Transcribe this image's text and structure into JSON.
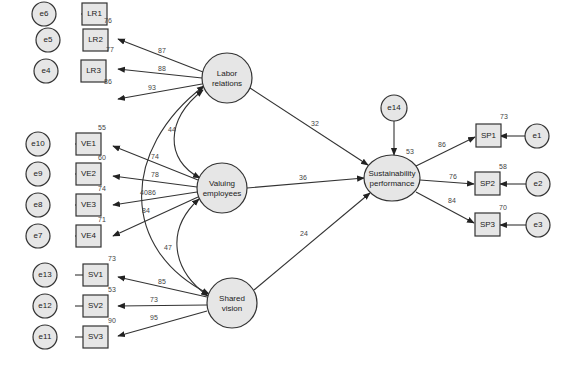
{
  "diagram": {
    "type": "structural-equation-model",
    "latents": [
      {
        "id": "LR",
        "label_lines": [
          "Labor",
          "relations"
        ],
        "cx": 227,
        "cy": 78,
        "r": 25
      },
      {
        "id": "VE",
        "label_lines": [
          "Valuing",
          "employees"
        ],
        "cx": 222,
        "cy": 188,
        "r": 25
      },
      {
        "id": "SV",
        "label_lines": [
          "Shared",
          "vision"
        ],
        "cx": 232,
        "cy": 303,
        "r": 25
      },
      {
        "id": "SP",
        "label_lines": [
          "Sustainability",
          "performance"
        ],
        "cx": 392,
        "cy": 178,
        "rx": 28,
        "ry": 23
      }
    ],
    "indicators": [
      {
        "id": "LR1",
        "x": 95,
        "y": 24,
        "r2": "76",
        "error": "e6",
        "loading": "87",
        "latent": "LR"
      },
      {
        "id": "LR2",
        "x": 95,
        "y": 68,
        "r2": "77",
        "error": "e5",
        "loading": "88",
        "latent": "LR"
      },
      {
        "id": "LR3",
        "x": 95,
        "y": 99,
        "r2": "86",
        "error": "e4",
        "loading": "93",
        "latent": "LR"
      },
      {
        "id": "VE1",
        "x": 95,
        "y": 144,
        "r2": "55",
        "error": "e10",
        "loading": "74",
        "latent": "VE"
      },
      {
        "id": "VE2",
        "x": 95,
        "y": 174,
        "r2": "60",
        "error": "e9",
        "loading": "78",
        "latent": "VE"
      },
      {
        "id": "VE3",
        "x": 95,
        "y": 205,
        "r2": "74",
        "error": "e8",
        "loading": "86",
        "latent": "VE"
      },
      {
        "id": "VE4",
        "x": 95,
        "y": 236,
        "r2": "71",
        "error": "e7",
        "loading": "84",
        "latent": "VE"
      },
      {
        "id": "SV1",
        "x": 95,
        "y": 274,
        "r2": "73",
        "error": "e13",
        "loading": "85",
        "latent": "SV"
      },
      {
        "id": "SV2",
        "x": 95,
        "y": 305,
        "r2": "53",
        "error": "e12",
        "loading": "73",
        "latent": "SV"
      },
      {
        "id": "SV3",
        "x": 95,
        "y": 336,
        "r2": "90",
        "error": "e11",
        "loading": "95",
        "latent": "SV"
      }
    ],
    "outcome_indicators": [
      {
        "id": "SP1",
        "x": 488,
        "y": 136,
        "r2": "73",
        "error": "e1",
        "loading": "86"
      },
      {
        "id": "SP2",
        "x": 487,
        "y": 184,
        "r2": "58",
        "error": "e2",
        "loading": "76"
      },
      {
        "id": "SP3",
        "x": 487,
        "y": 225,
        "r2": "70",
        "error": "e3",
        "loading": "84"
      }
    ],
    "structural_paths": [
      {
        "from": "LR",
        "to": "SP",
        "coef": "32"
      },
      {
        "from": "VE",
        "to": "SP",
        "coef": "36"
      },
      {
        "from": "SV",
        "to": "SP",
        "coef": "24"
      }
    ],
    "covariances": [
      {
        "between": [
          "LR",
          "VE"
        ],
        "value": "44"
      },
      {
        "between": [
          "VE",
          "SV"
        ],
        "value": "47"
      },
      {
        "between": [
          "LR",
          "SV"
        ],
        "value": "40"
      }
    ],
    "disturbance": {
      "id": "e14",
      "target": "SP",
      "r2": "53"
    }
  },
  "labels": {
    "LR1": "LR1",
    "LR2": "LR2",
    "LR3": "LR3",
    "VE1": "VE1",
    "VE2": "VE2",
    "VE3": "VE3",
    "VE4": "VE4",
    "SV1": "SV1",
    "SV2": "SV2",
    "SV3": "SV3",
    "SP1": "SP1",
    "SP2": "SP2",
    "SP3": "SP3",
    "e1": "e1",
    "e2": "e2",
    "e3": "e3",
    "e4": "e4",
    "e5": "e5",
    "e6": "e6",
    "e7": "e7",
    "e8": "e8",
    "e9": "e9",
    "e10": "e10",
    "e11": "e11",
    "e12": "e12",
    "e13": "e13",
    "e14": "e14",
    "LR_l1": "Labor",
    "LR_l2": "relations",
    "VE_l1": "Valuing",
    "VE_l2": "employees",
    "SV_l1": "Shared",
    "SV_l2": "vision",
    "SP_l1": "Sustainability",
    "SP_l2": "performance"
  },
  "values": {
    "r2_LR1": "76",
    "r2_LR2": "77",
    "r2_LR3": "86",
    "r2_VE1": "55",
    "r2_VE2": "60",
    "r2_VE3": "74",
    "r2_VE4": "71",
    "r2_SV1": "73",
    "r2_SV2": "53",
    "r2_SV3": "90",
    "r2_SP1": "73",
    "r2_SP2": "58",
    "r2_SP3": "70",
    "r2_SP": "53",
    "ld_LR1": "87",
    "ld_LR2": "88",
    "ld_LR3": "93",
    "ld_VE1": "74",
    "ld_VE2": "78",
    "ld_VE3": "86",
    "ld_VE4": "84",
    "ld_SV1": "85",
    "ld_SV2": "73",
    "ld_SV3": "95",
    "ld_SP1": "86",
    "ld_SP2": "76",
    "ld_SP3": "84",
    "path_LR_SP": "32",
    "path_VE_SP": "36",
    "path_SV_SP": "24",
    "cov_LR_VE": "44",
    "cov_VE_SV": "47",
    "cov_LR_SV": "40"
  }
}
